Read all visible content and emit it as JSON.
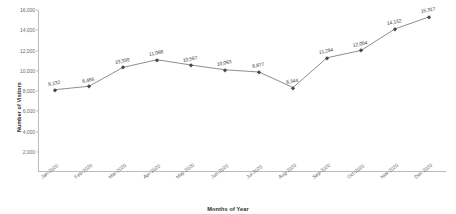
{
  "chart_data": {
    "type": "line",
    "title": "",
    "xlabel": "Months of Year",
    "ylabel": "Number of Visitors",
    "categories": [
      "Jan-2020",
      "Feb-2020",
      "Mar-2020",
      "Apr-2020",
      "May-2020",
      "Jun-2020",
      "Jul-2020",
      "Aug-2020",
      "Sep-2020",
      "Oct-2020",
      "Nov-2020",
      "Dec-2020"
    ],
    "values": [
      8132,
      8466,
      10330,
      11088,
      10567,
      10093,
      9877,
      8344,
      11284,
      12004,
      14132,
      15317
    ],
    "data_labels": [
      "8,132",
      "8,466",
      "10,330",
      "11,088",
      "10,567",
      "10,093",
      "9,877",
      "8,344",
      "11,284",
      "12,004",
      "14,132",
      "15,317"
    ],
    "ylim": [
      0,
      16000
    ],
    "ytick_values": [
      2000,
      4000,
      6000,
      8000,
      10000,
      12000,
      14000,
      16000
    ],
    "ytick_labels": [
      "2,000",
      "4,000",
      "6,000",
      "8,000",
      "10,000",
      "12,000",
      "14,000",
      "16,000"
    ],
    "grid": false,
    "legend": false,
    "legend_position": "none",
    "series_color": "#7a7a7a",
    "marker_color": "#4a4a4a",
    "axis_color": "#bdbdbd",
    "marker_shape": "diamond"
  }
}
